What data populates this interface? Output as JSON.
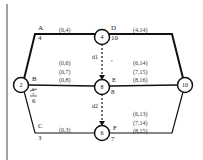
{
  "diagram": {
    "nodes": [
      {
        "id": "2",
        "label": "2",
        "cx": 21,
        "cy": 85
      },
      {
        "id": "4",
        "label": "4",
        "cx": 102,
        "cy": 37
      },
      {
        "id": "8",
        "label": "8",
        "cx": 102,
        "cy": 87
      },
      {
        "id": "6",
        "label": "6",
        "cx": 102,
        "cy": 133
      },
      {
        "id": "10",
        "label": "10",
        "cx": 185,
        "cy": 85
      }
    ],
    "activities": {
      "A": {
        "name": "A",
        "duration": "4",
        "pairs": [
          "(0,4)"
        ]
      },
      "B": {
        "name": "B",
        "duration_struck_1": "8",
        "duration_struck_2": "7",
        "duration": "6",
        "pairs": [
          "(0,6)",
          "(0,7)",
          "(0,8)"
        ]
      },
      "C": {
        "name": "C",
        "duration": "3",
        "pairs": [
          "(0,3)"
        ]
      },
      "D": {
        "name": "D",
        "duration": "10",
        "pairs": [
          "(4,14)"
        ]
      },
      "E": {
        "name": "E",
        "duration": "8",
        "pairs": [
          "(6,14)",
          "(7,15)",
          "(8,16)"
        ]
      },
      "F": {
        "name": "F",
        "duration": "7",
        "pairs": [
          "(6,13)",
          "(7,14)",
          "(8,15)"
        ]
      }
    },
    "dummies": {
      "d1": {
        "name": "d1",
        "mark": ","
      },
      "d2": {
        "name": "d2"
      }
    }
  }
}
